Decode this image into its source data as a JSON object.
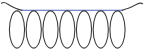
{
  "figure": {
    "background_color": "#ffffff",
    "wire_color": "#3d3d3d",
    "core_line_color": "#5060c0",
    "loop_count": 7,
    "geometry": {
      "canvas_width": 144,
      "canvas_height": 51,
      "loop_first_cx": 17,
      "loop_spacing": 16.75,
      "loop_cy": 29.5,
      "loop_rx": 7.6,
      "loop_ry": 18.6,
      "stroke_width": 1.1,
      "core_line": {
        "x1": 21,
        "y1": 10.2,
        "x2": 123,
        "y2": 10.2
      },
      "left_lead_path": "M 1.5 3.2 C 3 2.1, 5.2 2.4, 7.5 4 C 12 6.9, 16.5 9.2, 22 10.2",
      "right_lead_path": "M 122 10.2 C 128.5 8.9, 133 6.3, 136.8 4.3 C 139.2 3.0, 141.4 2.8, 142.6 3.7"
    }
  }
}
